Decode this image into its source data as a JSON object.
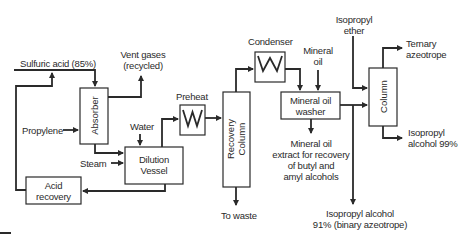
{
  "diagram": {
    "line_color": "#2a2a2a",
    "background": "#ffffff",
    "units": {
      "absorber": "Absorber",
      "acid_recovery": [
        "Acid",
        "recovery"
      ],
      "dilution_vessel": [
        "Dilution",
        "Vessel"
      ],
      "preheat": "Preheat",
      "recovery_column": [
        "Recovery",
        "Column"
      ],
      "condenser": "Condenser",
      "mineral_oil_washer": [
        "Mineral oil",
        "washer"
      ],
      "column": "Column"
    },
    "streams": {
      "sulfuric_acid": "Sulfuric acid (85%)",
      "vent_gases": [
        "Vent gases",
        "(recycled)"
      ],
      "propylene": "Propylene",
      "water": "Water",
      "steam": "Steam",
      "mineral_oil": [
        "Mineral",
        "oil"
      ],
      "isopropyl_ether": [
        "Isopropyl",
        "ether"
      ],
      "ternary_azeotrope": [
        "Ternary",
        "azeotrope"
      ],
      "isopropyl_alcohol_99": [
        "Isopropyl",
        "alcohol 99%"
      ],
      "mineral_oil_extract": [
        "Mineral oil",
        "extract for recovery",
        "of butyl and",
        "amyl alcohols"
      ],
      "to_waste": "To waste",
      "isopropyl_alcohol_91": [
        "Isopropyl alcohol",
        "91% (binary azeotrope)"
      ]
    }
  }
}
